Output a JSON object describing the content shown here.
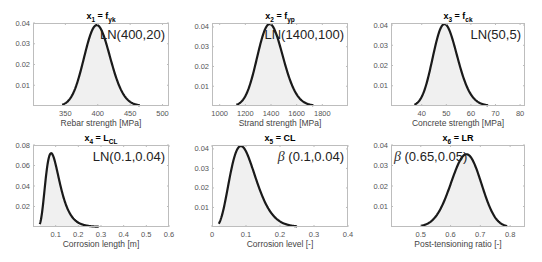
{
  "chart_data": [
    {
      "type": "area",
      "title": "x_1 = f_yk",
      "title_main": "x",
      "title_index": "1",
      "title_eq": " = f",
      "title_sub": "yk",
      "annotation": "LN(400,20)",
      "annotation_prefix": "",
      "annotation_pos": "top-right",
      "distribution": {
        "family": "lognormal",
        "mean": 400,
        "std": 20
      },
      "xlabel": "Rebar strength [MPa]",
      "ylabel": "",
      "xlim": [
        300,
        510
      ],
      "ylim": [
        0,
        0.04
      ],
      "xticks": [
        350,
        400,
        450,
        500
      ],
      "yticks": [
        0.01,
        0.02,
        0.03,
        0.04
      ],
      "curve_range": [
        345,
        465
      ],
      "peak": {
        "x": 399,
        "y": 0.039
      },
      "grid": false
    },
    {
      "type": "area",
      "title": "x_2 = f_yp",
      "title_main": "x",
      "title_index": "2",
      "title_eq": " = f",
      "title_sub": "yp",
      "annotation": "LN(1400,100)",
      "annotation_prefix": "",
      "annotation_pos": "top-right",
      "distribution": {
        "family": "lognormal",
        "mean": 1400,
        "std": 100
      },
      "xlabel": "Strand strength [MPa]",
      "ylabel": "",
      "xlim": [
        940,
        2000
      ],
      "ylim": [
        0,
        0.042
      ],
      "xticks": [
        1000,
        1200,
        1400,
        1600,
        1800
      ],
      "yticks": [
        0.01,
        0.02,
        0.03,
        0.04
      ],
      "curve_range": [
        1130,
        1730
      ],
      "peak": {
        "x": 1395,
        "y": 0.0415
      },
      "grid": false
    },
    {
      "type": "area",
      "title": "x_3 = f_ck",
      "title_main": "x",
      "title_index": "3",
      "title_eq": " = f",
      "title_sub": "ck",
      "annotation": "LN(50,5)",
      "annotation_prefix": "",
      "annotation_pos": "top-right",
      "distribution": {
        "family": "lognormal",
        "mean": 50,
        "std": 5
      },
      "xlabel": "Concrete strength [MPa]",
      "ylabel": "",
      "xlim": [
        27.5,
        82
      ],
      "ylim": [
        0,
        0.041
      ],
      "xticks": [
        40,
        50,
        60,
        70,
        80
      ],
      "yticks": [
        0.01,
        0.02,
        0.03,
        0.04
      ],
      "curve_range": [
        37,
        67
      ],
      "peak": {
        "x": 49.5,
        "y": 0.0405
      },
      "grid": false
    },
    {
      "type": "area",
      "title": "x_4 = L_CL",
      "title_main": "x",
      "title_index": "4",
      "title_eq": " = L",
      "title_sub": "CL",
      "annotation": "LN(0.1,0.04)",
      "annotation_prefix": "",
      "annotation_pos": "top-right",
      "distribution": {
        "family": "lognormal",
        "mean": 0.1,
        "std": 0.04
      },
      "xlabel": "Corrosion length [m]",
      "ylabel": "",
      "xlim": [
        0,
        0.6
      ],
      "ylim": [
        0,
        0.08
      ],
      "xticks": [
        0.1,
        0.2,
        0.3,
        0.4,
        0.5,
        0.6
      ],
      "yticks": [
        0.02,
        0.04,
        0.06,
        0.08
      ],
      "curve_range": [
        0.03,
        0.29
      ],
      "peak": {
        "x": 0.083,
        "y": 0.072
      },
      "grid": false
    },
    {
      "type": "area",
      "title": "x_5 = CL",
      "title_main": "x",
      "title_index": "5",
      "title_eq": " = CL",
      "title_sub": "",
      "annotation": "(0.1,0.04)",
      "annotation_prefix": "β",
      "annotation_pos": "top-right",
      "distribution": {
        "family": "beta",
        "mean": 0.1,
        "std": 0.04
      },
      "xlabel": "Corrosion level [-]",
      "ylabel": "",
      "xlim": [
        0,
        0.4
      ],
      "ylim": [
        0,
        0.042
      ],
      "xticks": [
        0,
        0.1,
        0.2,
        0.3,
        0.4
      ],
      "yticks": [
        0.01,
        0.02,
        0.03,
        0.04
      ],
      "curve_range": [
        0.02,
        0.25
      ],
      "peak": {
        "x": 0.085,
        "y": 0.0415
      },
      "grid": false
    },
    {
      "type": "area",
      "title": "x_6 = LR",
      "title_main": "x",
      "title_index": "6",
      "title_eq": " = LR",
      "title_sub": "",
      "annotation": "(0.65,0.05)",
      "annotation_prefix": "β",
      "annotation_pos": "top-left",
      "distribution": {
        "family": "beta",
        "mean": 0.65,
        "std": 0.05
      },
      "xlabel": "Post-tensioning ratio [-]",
      "ylabel": "",
      "xlim": [
        0.4,
        0.85
      ],
      "ylim": [
        0,
        0.04
      ],
      "xticks": [
        0.5,
        0.6,
        0.7,
        0.8
      ],
      "yticks": [
        0.01,
        0.02,
        0.03,
        0.04
      ],
      "curve_range": [
        0.5,
        0.79
      ],
      "peak": {
        "x": 0.655,
        "y": 0.0355
      },
      "grid": false
    }
  ],
  "colors": {
    "curve": "#1a1a1a",
    "fill": "#f0f0f0",
    "axis": "#bdbdbd",
    "tick_label": "#555555"
  },
  "layout": {
    "panels": [
      {
        "left": 33,
        "top": 23,
        "right": 169,
        "bottom": 106
      },
      {
        "left": 212,
        "top": 23,
        "right": 348,
        "bottom": 106
      },
      {
        "left": 391,
        "top": 23,
        "right": 525,
        "bottom": 106
      },
      {
        "left": 33,
        "top": 145,
        "right": 169,
        "bottom": 227
      },
      {
        "left": 212,
        "top": 145,
        "right": 348,
        "bottom": 227
      },
      {
        "left": 391,
        "top": 145,
        "right": 525,
        "bottom": 227
      }
    ]
  }
}
